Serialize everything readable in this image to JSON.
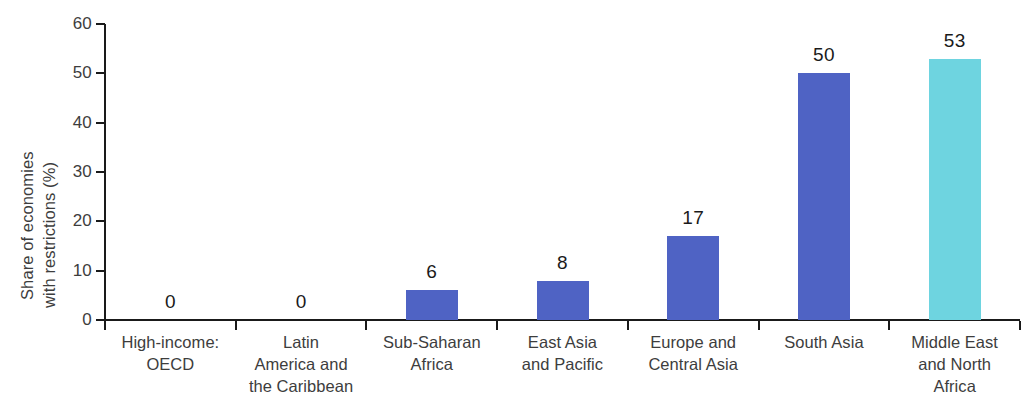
{
  "chart_data": {
    "type": "bar",
    "title": "",
    "xlabel": "",
    "ylabel": "Share of economies with restrictions (%)",
    "ylabel_lines": [
      "Share of economies",
      "with restrictions (%)"
    ],
    "ylim": [
      0,
      60
    ],
    "yticks": [
      0,
      10,
      20,
      30,
      40,
      50,
      60
    ],
    "ytick_labels": [
      "0",
      "10",
      "20",
      "30",
      "40",
      "50",
      "60"
    ],
    "grid": false,
    "legend": "none",
    "categories": [
      "High-income: OECD",
      "Latin America and the Caribbean",
      "Sub-Saharan Africa",
      "East Asia and Pacific",
      "Europe and Central Asia",
      "South Asia",
      "Middle East and North Africa"
    ],
    "category_label_lines": [
      [
        "High-income:",
        "OECD"
      ],
      [
        "Latin",
        "America and",
        "the Caribbean"
      ],
      [
        "Sub-Saharan",
        "Africa"
      ],
      [
        "East Asia",
        "and Pacific"
      ],
      [
        "Europe and",
        "Central Asia"
      ],
      [
        "South Asia"
      ],
      [
        "Middle East",
        "and North",
        "Africa"
      ]
    ],
    "values": [
      0,
      0,
      6,
      8,
      17,
      50,
      53
    ],
    "value_labels": [
      "0",
      "0",
      "6",
      "8",
      "17",
      "50",
      "53"
    ],
    "bar_colors": [
      "#4f63c4",
      "#4f63c4",
      "#4f63c4",
      "#4f63c4",
      "#4f63c4",
      "#4f63c4",
      "#6ed4e0"
    ],
    "colors": {
      "bar_primary": "#4f63c4",
      "bar_highlight": "#6ed4e0",
      "axis": "#1a1a1a",
      "text": "#3d3d3d",
      "value_text": "#1a1a1a",
      "background": "#ffffff"
    }
  }
}
